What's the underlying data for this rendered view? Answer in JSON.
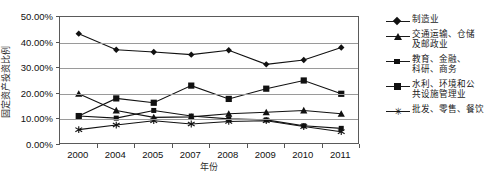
{
  "chart_data": {
    "type": "line",
    "title": "",
    "xlabel": "年份",
    "ylabel": "固定资产投资比例",
    "categories": [
      "2000",
      "2004",
      "2005",
      "2007",
      "2008",
      "2009",
      "2010",
      "2011"
    ],
    "ylim": [
      0,
      50
    ],
    "ytick_labels": [
      "0.00%",
      "10.00%",
      "20.00%",
      "30.00%",
      "40.00%",
      "50.00%"
    ],
    "ytick_values": [
      0,
      10,
      20,
      30,
      40,
      50
    ],
    "grid": true,
    "legend_position": "right",
    "series": [
      {
        "name": "制造业",
        "marker": "diamond",
        "color": "#111111",
        "values": [
          43.5,
          37.2,
          36.3,
          35.3,
          37.0,
          31.5,
          33.2,
          38.1
        ]
      },
      {
        "name": "交通运输、仓储\n及邮政业",
        "marker": "triangle",
        "color": "#111111",
        "values": [
          20.0,
          13.5,
          10.8,
          11.0,
          12.2,
          12.8,
          13.5,
          12.2
        ]
      },
      {
        "name": "教育、金融、\n科研、商务",
        "marker": "square-sm",
        "color": "#111111",
        "values": [
          11.3,
          10.5,
          13.5,
          11.3,
          10.2,
          9.8,
          7.5,
          6.5
        ]
      },
      {
        "name": "水利、环境和公\n共设施管理业",
        "marker": "square",
        "color": "#111111",
        "values": [
          11.3,
          18.2,
          16.5,
          23.2,
          18.0,
          22.0,
          25.2,
          20.0
        ]
      },
      {
        "name": "批发、零售、餐饮",
        "marker": "star",
        "color": "#111111",
        "values": [
          6.0,
          7.8,
          9.5,
          8.2,
          9.2,
          9.5,
          7.2,
          5.2
        ]
      }
    ]
  }
}
